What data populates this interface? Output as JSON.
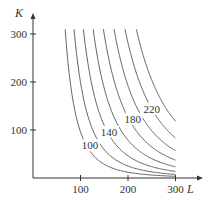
{
  "chart_data": {
    "type": "line",
    "title": "",
    "xlabel": "L",
    "ylabel": "K",
    "xlim": [
      0,
      300
    ],
    "ylim": [
      0,
      300
    ],
    "grid": false,
    "legend": "none",
    "x_ticks": [
      100,
      200,
      300
    ],
    "y_ticks": [
      100,
      200,
      300
    ],
    "function": "P = 1.01 * L^0.75 * K^0.25",
    "series": [
      {
        "name": "100",
        "level": 100,
        "labeled": true
      },
      {
        "name": "120",
        "level": 120,
        "labeled": false
      },
      {
        "name": "140",
        "level": 140,
        "labeled": true
      },
      {
        "name": "160",
        "level": 160,
        "labeled": false
      },
      {
        "name": "180",
        "level": 180,
        "labeled": true
      },
      {
        "name": "200",
        "level": 200,
        "labeled": false
      },
      {
        "name": "220",
        "level": 220,
        "labeled": true
      },
      {
        "name": "240",
        "level": 240,
        "labeled": false
      }
    ],
    "annotations": [
      {
        "text": "100",
        "x": 120,
        "y": 62
      },
      {
        "text": "140",
        "x": 160,
        "y": 90
      },
      {
        "text": "180",
        "x": 210,
        "y": 117
      },
      {
        "text": "220",
        "x": 250,
        "y": 138
      }
    ]
  },
  "colors": {
    "axis": "#333333",
    "curve": "#555555",
    "text": "#333333"
  }
}
